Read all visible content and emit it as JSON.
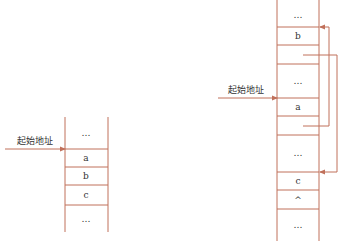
{
  "colors": {
    "line": "#c0705a",
    "text": "#333333",
    "background": "#ffffff"
  },
  "left_diagram": {
    "start_label": "起始地址",
    "cells": [
      "…",
      "a",
      "b",
      "c",
      "…"
    ]
  },
  "right_diagram": {
    "start_label": "起始地址",
    "cells": [
      "…",
      "b",
      "",
      "…",
      "a",
      "",
      "…",
      "c",
      "^",
      "…"
    ],
    "pointers": [
      {
        "from_cell": 2,
        "to_cell": 7,
        "description": "next pointer after b points to c"
      },
      {
        "from_cell": 5,
        "to_cell": 1,
        "description": "next pointer after a points to b"
      }
    ]
  }
}
